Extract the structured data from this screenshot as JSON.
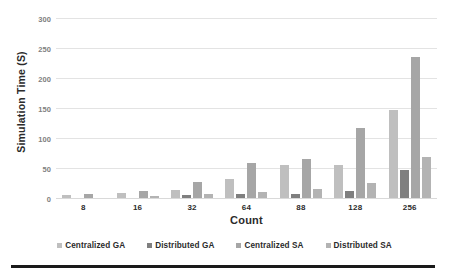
{
  "chart_data": {
    "type": "bar",
    "title": "",
    "xlabel": "Count",
    "ylabel": "Simulation Time (S)",
    "categories": [
      "8",
      "16",
      "32",
      "64",
      "88",
      "128",
      "256"
    ],
    "series": [
      {
        "name": "Centralized GA",
        "color": "#bfbfbf",
        "values": [
          6,
          10,
          15,
          33,
          56,
          57,
          148
        ]
      },
      {
        "name": "Distributed GA",
        "color": "#7f7f7f",
        "values": [
          1,
          1,
          6,
          8,
          9,
          13,
          49
        ]
      },
      {
        "name": "Centralized SA",
        "color": "#a6a6a6",
        "values": [
          9,
          14,
          28,
          60,
          66,
          119,
          236
        ]
      },
      {
        "name": "Distributed SA",
        "color": "#b3b3b3",
        "values": [
          1,
          5,
          8,
          11,
          16,
          26,
          70
        ]
      }
    ],
    "ylim": [
      0,
      300
    ],
    "yticks": [
      0,
      50,
      100,
      150,
      200,
      250,
      300
    ],
    "ytick_labels": [
      "0",
      "50",
      "100",
      "150",
      "200",
      "250",
      "300"
    ],
    "grid": true,
    "legend_position": "bottom"
  },
  "axes": {
    "y_title": "Simulation Time (S)",
    "x_title": "Count"
  }
}
